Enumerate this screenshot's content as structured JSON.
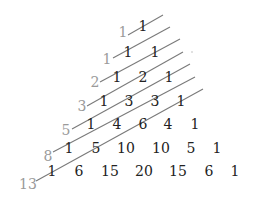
{
  "diagram": {
    "colors": {
      "numbers": "#222222",
      "fibonacci_labels": "#9a9a9a",
      "lines": "#7a7a7a"
    },
    "rows": [
      {
        "values": [
          "1"
        ],
        "xs": [
          143
        ],
        "y": 31
      },
      {
        "values": [
          "1",
          "1"
        ],
        "xs": [
          128,
          155
        ],
        "y": 57
      },
      {
        "values": [
          "1",
          "2",
          "1"
        ],
        "xs": [
          117,
          143,
          169
        ],
        "y": 82
      },
      {
        "values": [
          "1",
          "3",
          "3",
          "1"
        ],
        "xs": [
          104,
          129,
          155,
          181
        ],
        "y": 106
      },
      {
        "values": [
          "1",
          "4",
          "6",
          "4",
          "1"
        ],
        "xs": [
          91,
          117,
          143,
          168,
          195
        ],
        "y": 129
      },
      {
        "values": [
          "1",
          "5",
          "10",
          "10",
          "5",
          "1"
        ],
        "xs": [
          69,
          96,
          126,
          161,
          191,
          217
        ],
        "y": 153
      },
      {
        "values": [
          "1",
          "6",
          "15",
          "20",
          "15",
          "6",
          "1"
        ],
        "xs": [
          52,
          79,
          110,
          144,
          178,
          209,
          235
        ],
        "y": 176
      }
    ],
    "fibonacci": [
      {
        "label": "1",
        "x": 123,
        "y": 37
      },
      {
        "label": "1",
        "x": 107,
        "y": 64
      },
      {
        "label": "2",
        "x": 95,
        "y": 87
      },
      {
        "label": "3",
        "x": 82,
        "y": 111
      },
      {
        "label": "5",
        "x": 66,
        "y": 135
      },
      {
        "label": "8",
        "x": 48,
        "y": 161
      },
      {
        "label": "13",
        "x": 28,
        "y": 189
      }
    ],
    "lines": [
      {
        "x1": 128,
        "y1": 35,
        "x2": 163,
        "y2": 15
      },
      {
        "x1": 113,
        "y1": 58,
        "x2": 170,
        "y2": 27
      },
      {
        "x1": 100,
        "y1": 82,
        "x2": 180,
        "y2": 39
      },
      {
        "x1": 87,
        "y1": 106,
        "x2": 183,
        "y2": 52
      },
      {
        "x1": 72,
        "y1": 129,
        "x2": 190,
        "y2": 64
      },
      {
        "x1": 53,
        "y1": 152,
        "x2": 195,
        "y2": 77
      },
      {
        "x1": 36,
        "y1": 181,
        "x2": 203,
        "y2": 89
      }
    ]
  }
}
